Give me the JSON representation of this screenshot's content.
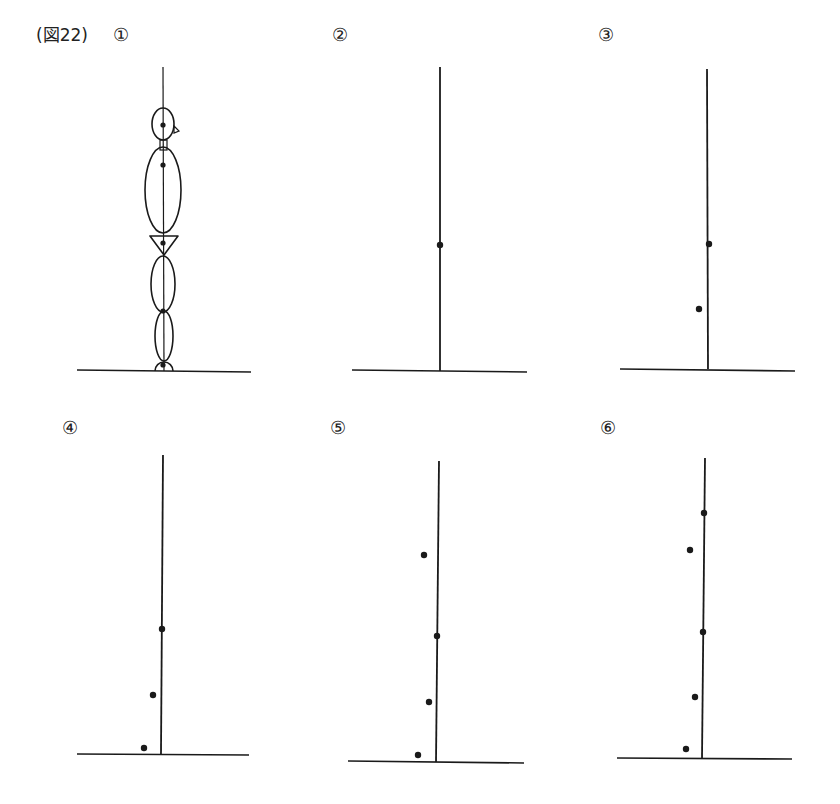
{
  "figure": {
    "title": "(図22)",
    "colors": {
      "ink": "#1a1a1a",
      "background": "#ffffff"
    }
  },
  "panels": [
    {
      "label": "①",
      "label_pos": [
        113,
        26
      ],
      "kind": "stick-figure",
      "vertical_line": {
        "x1": 163,
        "y1": 67,
        "x2": 164,
        "y2": 371
      },
      "ground": {
        "x1": 77,
        "y1": 370,
        "x2": 251,
        "y2": 372
      },
      "dots": [
        [
          163,
          125
        ],
        [
          163,
          165
        ],
        [
          163,
          243
        ],
        [
          163,
          311
        ],
        [
          163,
          365
        ]
      ],
      "body_parts": {
        "head": {
          "cx": 163,
          "cy": 124,
          "rx": 11,
          "ry": 16
        },
        "nose": [
          [
            174,
            126
          ],
          [
            179,
            131
          ],
          [
            174,
            133
          ]
        ],
        "neck": {
          "x": 160,
          "y": 140,
          "w": 7,
          "h": 10
        },
        "torso": {
          "cx": 163,
          "cy": 190,
          "rx": 18,
          "ry": 43
        },
        "pelvis": [
          [
            150,
            236
          ],
          [
            178,
            236
          ],
          [
            164,
            255
          ]
        ],
        "thigh": {
          "cx": 163,
          "cy": 284,
          "rx": 12,
          "ry": 28
        },
        "shin": {
          "cx": 164,
          "cy": 336,
          "rx": 9,
          "ry": 25
        },
        "foot": {
          "cx": 164,
          "cy": 371,
          "r": 9
        }
      }
    },
    {
      "label": "②",
      "label_pos": [
        332,
        26
      ],
      "kind": "points",
      "vertical_line": {
        "x1": 440,
        "y1": 67,
        "x2": 440,
        "y2": 371
      },
      "ground": {
        "x1": 352,
        "y1": 370,
        "x2": 527,
        "y2": 372
      },
      "dots": [
        [
          440,
          245
        ]
      ]
    },
    {
      "label": "③",
      "label_pos": [
        598,
        26
      ],
      "kind": "points",
      "vertical_line": {
        "x1": 707,
        "y1": 69,
        "x2": 708,
        "y2": 369
      },
      "ground": {
        "x1": 620,
        "y1": 369,
        "x2": 795,
        "y2": 371
      },
      "dots": [
        [
          709,
          244
        ],
        [
          699,
          309
        ]
      ]
    },
    {
      "label": "④",
      "label_pos": [
        62,
        419
      ],
      "kind": "points",
      "vertical_line": {
        "x1": 163,
        "y1": 455,
        "x2": 161,
        "y2": 754
      },
      "ground": {
        "x1": 77,
        "y1": 754,
        "x2": 249,
        "y2": 755
      },
      "dots": [
        [
          162,
          629
        ],
        [
          153,
          695
        ],
        [
          144,
          748
        ]
      ]
    },
    {
      "label": "⑤",
      "label_pos": [
        330,
        419
      ],
      "kind": "points",
      "vertical_line": {
        "x1": 439,
        "y1": 461,
        "x2": 436,
        "y2": 762
      },
      "ground": {
        "x1": 348,
        "y1": 761,
        "x2": 524,
        "y2": 763
      },
      "dots": [
        [
          424,
          555
        ],
        [
          437,
          636
        ],
        [
          429,
          702
        ],
        [
          418,
          755
        ]
      ]
    },
    {
      "label": "⑥",
      "label_pos": [
        600,
        419
      ],
      "kind": "points",
      "vertical_line": {
        "x1": 705,
        "y1": 458,
        "x2": 702,
        "y2": 758
      },
      "ground": {
        "x1": 617,
        "y1": 758,
        "x2": 792,
        "y2": 759
      },
      "dots": [
        [
          704,
          513
        ],
        [
          690,
          550
        ],
        [
          703,
          632
        ],
        [
          695,
          697
        ],
        [
          686,
          749
        ]
      ]
    }
  ]
}
